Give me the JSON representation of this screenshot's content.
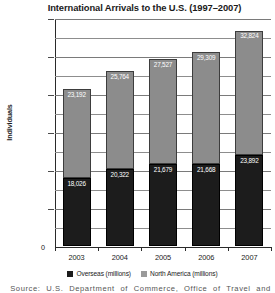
{
  "chart_data": {
    "type": "bar",
    "subtype": "stacked-column",
    "title": "International Arrivals to the U.S. (1997–2007)",
    "xlabel": "",
    "ylabel": "Individuals",
    "categories": [
      "2003",
      "2004",
      "2005",
      "2006",
      "2007"
    ],
    "series": [
      {
        "name": "Overseas (millions)",
        "color": "#1c1c1c",
        "values": [
          18026,
          20322,
          21679,
          21668,
          23892
        ],
        "labels": [
          "18,026",
          "20,322",
          "21,679",
          "21,668",
          "23,892"
        ]
      },
      {
        "name": "North America (millions)",
        "color": "#8c8c8c",
        "values": [
          23192,
          25764,
          27527,
          29309,
          32824
        ],
        "labels": [
          "23,192",
          "25,764",
          "27,527",
          "29,309",
          "32,824"
        ]
      }
    ],
    "totals": [
      41218,
      46086,
      49206,
      50977,
      56716
    ],
    "ylim": [
      0,
      60000
    ],
    "ytick_values": [
      60000,
      50000,
      40000,
      30000,
      20000,
      10000,
      0
    ],
    "ytick_labels": [
      "60,000",
      "50,000",
      "40,000",
      "30,000",
      "20,000",
      "10,000",
      "0"
    ],
    "minor_gridlines": [
      55000,
      45000,
      35000,
      25000,
      15000,
      5000
    ],
    "grid": true,
    "legend_position": "bottom"
  },
  "legend": {
    "items": [
      {
        "label": "Overseas (millions)",
        "swatch": "overseas"
      },
      {
        "label": "North America (millions)",
        "swatch": "northamerica"
      }
    ]
  },
  "footer": {
    "source": "Source:   U.S. Department of Commerce,   Office of Travel and"
  }
}
